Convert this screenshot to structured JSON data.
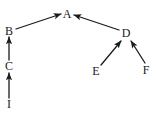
{
  "diagram": {
    "background_color": "#ffffff",
    "ink_color": "#1a1a1a",
    "width": 156,
    "height": 126
  },
  "chart_data": {
    "type": "diagram",
    "subtype": "directed-graph",
    "title": "",
    "nodes": [
      {
        "id": "A",
        "label": "A",
        "x": 67,
        "y": 14
      },
      {
        "id": "B",
        "label": "B",
        "x": 9,
        "y": 31
      },
      {
        "id": "C",
        "label": "C",
        "x": 9,
        "y": 66
      },
      {
        "id": "I",
        "label": "I",
        "x": 9,
        "y": 104
      },
      {
        "id": "D",
        "label": "D",
        "x": 126,
        "y": 33
      },
      {
        "id": "E",
        "label": "E",
        "x": 96,
        "y": 71
      },
      {
        "id": "F",
        "label": "F",
        "x": 146,
        "y": 70
      }
    ],
    "edges": [
      {
        "from": "B",
        "to": "A",
        "x1": 16,
        "y1": 29,
        "x2": 61,
        "y2": 14,
        "arrow": "end"
      },
      {
        "from": "D",
        "to": "A",
        "x1": 119,
        "y1": 30,
        "x2": 74,
        "y2": 15,
        "arrow": "end"
      },
      {
        "from": "C",
        "to": "B",
        "x1": 9,
        "y1": 60,
        "x2": 9,
        "y2": 37,
        "arrow": "end"
      },
      {
        "from": "I",
        "to": "C",
        "x1": 9,
        "y1": 98,
        "x2": 9,
        "y2": 73,
        "arrow": "end"
      },
      {
        "from": "E",
        "to": "D",
        "x1": 101,
        "y1": 65,
        "x2": 121,
        "y2": 41,
        "arrow": "end"
      },
      {
        "from": "F",
        "to": "D",
        "x1": 145,
        "y1": 63,
        "x2": 131,
        "y2": 41,
        "arrow": "end"
      }
    ],
    "node_count": 7,
    "edge_count": 6,
    "legend": [],
    "annotations": []
  }
}
